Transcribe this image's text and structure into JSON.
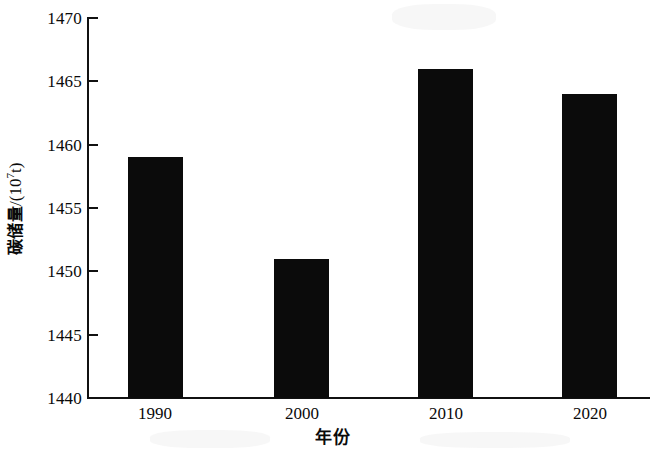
{
  "chart_data": {
    "type": "bar",
    "title": "",
    "categories": [
      "1990",
      "2000",
      "2010",
      "2020"
    ],
    "values": [
      1459,
      1451,
      1466,
      1464
    ],
    "series": [
      {
        "name": "碳储量",
        "values": [
          1459,
          1451,
          1466,
          1464
        ]
      }
    ],
    "xlabel": "年份",
    "ylabel": "碳储量/(10⁷t)",
    "ylabel_text": "碳储量",
    "ylabel_unit_prefix": "/(10",
    "ylabel_unit_exponent": "7",
    "ylabel_unit_suffix": "t)",
    "ylim": [
      1440,
      1470
    ],
    "ytick_labels": [
      "1470",
      "1465",
      "1460",
      "1455",
      "1450",
      "1445",
      "1440"
    ],
    "ytick_values": [
      1470,
      1465,
      1460,
      1455,
      1450,
      1445,
      1440
    ],
    "xtick_labels": [
      "1990",
      "2000",
      "2010",
      "2020"
    ],
    "grid": false,
    "legend": false,
    "legend_position": "none",
    "bar_color": "#0b0b0b",
    "axis_color": "#111111",
    "background_color": "#ffffff"
  }
}
